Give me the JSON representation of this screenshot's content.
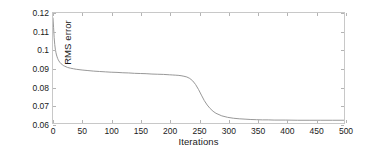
{
  "chart_data": {
    "type": "line",
    "title": "",
    "xlabel": "Iterations",
    "ylabel": "RMS error",
    "xlim": [
      0,
      500
    ],
    "ylim": [
      0.06,
      0.12
    ],
    "grid": false,
    "legend": null,
    "line_color": "#8c8c8c",
    "axis_color": "#c8c8c8",
    "xticks": [
      0,
      50,
      100,
      150,
      200,
      250,
      300,
      350,
      400,
      450,
      500
    ],
    "xtick_labels": [
      "0",
      "50",
      "100",
      "150",
      "200",
      "250",
      "300",
      "350",
      "400",
      "450",
      "500"
    ],
    "yticks": [
      0.06,
      0.07,
      0.08,
      0.09,
      0.1,
      0.11,
      0.12
    ],
    "ytick_labels": [
      "0.06",
      "0.07",
      "0.08",
      "0.09",
      "0.1",
      "0.11",
      "0.12"
    ],
    "series": [
      {
        "name": "RMS error",
        "x": [
          0,
          1,
          2,
          3,
          4,
          5,
          6,
          7,
          8,
          9,
          10,
          12,
          14,
          16,
          18,
          20,
          25,
          30,
          35,
          40,
          50,
          60,
          70,
          80,
          90,
          100,
          110,
          120,
          130,
          140,
          150,
          160,
          170,
          180,
          190,
          200,
          205,
          210,
          215,
          220,
          225,
          230,
          235,
          240,
          245,
          250,
          255,
          260,
          265,
          270,
          275,
          280,
          290,
          300,
          310,
          320,
          330,
          340,
          350,
          360,
          370,
          380,
          390,
          400,
          420,
          440,
          460,
          480,
          500
        ],
        "y": [
          0.1173,
          0.112,
          0.1065,
          0.1028,
          0.1003,
          0.0985,
          0.0971,
          0.0961,
          0.0952,
          0.0945,
          0.0939,
          0.093,
          0.0923,
          0.0918,
          0.0913,
          0.091,
          0.0903,
          0.0899,
          0.0896,
          0.0893,
          0.0889,
          0.0886,
          0.0883,
          0.0881,
          0.0879,
          0.0877,
          0.0876,
          0.0874,
          0.0873,
          0.0871,
          0.087,
          0.0869,
          0.0867,
          0.0866,
          0.0865,
          0.0863,
          0.0862,
          0.0861,
          0.086,
          0.0858,
          0.0855,
          0.0851,
          0.0843,
          0.083,
          0.081,
          0.0783,
          0.0752,
          0.0722,
          0.0698,
          0.0679,
          0.0664,
          0.0653,
          0.0639,
          0.0631,
          0.0626,
          0.0623,
          0.0621,
          0.0619,
          0.0618,
          0.0617,
          0.0617,
          0.0616,
          0.0616,
          0.0616,
          0.0615,
          0.0615,
          0.0615,
          0.0615,
          0.0615
        ]
      }
    ]
  }
}
